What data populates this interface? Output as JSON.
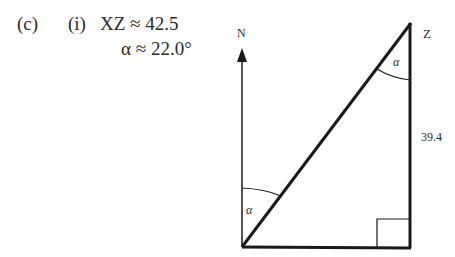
{
  "answer": {
    "part_label": "(c)",
    "sub_label": "(i)",
    "line1": "XZ ≈ 42.5",
    "line2": "α ≈ 22.0°"
  },
  "diagram": {
    "north_label": "N",
    "vertex_label": "Z",
    "side_label": "39.4",
    "angle_top_label": "α",
    "angle_bottom_label": "α",
    "stroke_color": "#1a1a1a"
  }
}
